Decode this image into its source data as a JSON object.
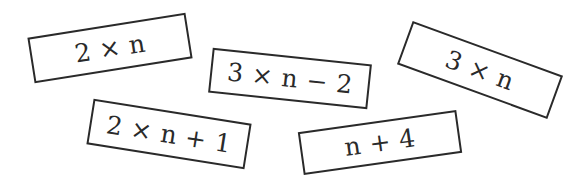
{
  "diagram": {
    "type": "expression-cards",
    "cards": [
      {
        "id": "card-1",
        "expression": "2 × n",
        "center": [
          110,
          48
        ],
        "width": 160,
        "height": 46,
        "rotation_deg": -9
      },
      {
        "id": "card-2",
        "expression": "3 × n − 2",
        "center": [
          290,
          79
        ],
        "width": 160,
        "height": 45,
        "rotation_deg": 6
      },
      {
        "id": "card-3",
        "expression": "3 × n",
        "center": [
          480,
          70
        ],
        "width": 160,
        "height": 46,
        "rotation_deg": 20
      },
      {
        "id": "card-4",
        "expression": "2 × n + 1",
        "center": [
          169,
          134
        ],
        "width": 160,
        "height": 46,
        "rotation_deg": 9
      },
      {
        "id": "card-5",
        "expression": "n + 4",
        "center": [
          380,
          143
        ],
        "width": 160,
        "height": 43,
        "rotation_deg": -8
      }
    ],
    "colors": {
      "border": "#2a2a2a",
      "text": "#2a2a2a",
      "background": "#ffffff"
    }
  }
}
